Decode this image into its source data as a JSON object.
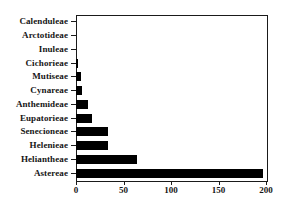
{
  "chart_data": {
    "type": "bar",
    "orientation": "horizontal",
    "title": "",
    "subtitle": "",
    "xlabel": "",
    "ylabel": "",
    "categories": [
      "Calenduleae",
      "Arctotideae",
      "Inuleae",
      "Cichorieae",
      "Mutiseae",
      "Cynareae",
      "Anthemideae",
      "Eupatorieae",
      "Senecioneae",
      "Helenieae",
      "Heliantheae",
      "Astereae"
    ],
    "values": [
      0,
      0,
      0,
      2,
      5,
      6,
      13,
      17,
      34,
      34,
      64,
      197
    ],
    "xlim": [
      0,
      200
    ],
    "xticks": [
      0,
      50,
      100,
      150,
      200
    ],
    "xtick_labels": [
      "0",
      "50",
      "100",
      "150",
      "200"
    ],
    "grid": false,
    "legend": false,
    "bar_color": "#000000",
    "frame_color": "#1a1a1a",
    "background_color": "#ffffff"
  }
}
